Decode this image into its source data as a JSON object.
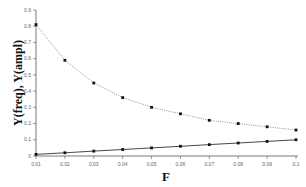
{
  "chart_data": {
    "type": "line",
    "title": "",
    "xlabel": "F",
    "ylabel": "Y(freq), Y(ampl)",
    "x": [
      0.01,
      0.02,
      0.03,
      0.04,
      0.05,
      0.06,
      0.07,
      0.08,
      0.09,
      0.1
    ],
    "x_tick_labels": [
      "0.01",
      "0.02",
      "0.03",
      "0.04",
      "0.05",
      "0.06",
      "0.07",
      "0.08",
      "0.09",
      "0.1"
    ],
    "y_tick_labels": [
      "0",
      "0.1",
      "0.2",
      "0.3",
      "0.4",
      "0.5",
      "0.6",
      "0.7",
      "0.8",
      "0.9"
    ],
    "xlim": [
      0.01,
      0.1
    ],
    "ylim": [
      0,
      0.9
    ],
    "grid": false,
    "legend": null,
    "series": [
      {
        "name": "Y(ampl)",
        "style": "dotted",
        "values": [
          0.81,
          0.59,
          0.45,
          0.36,
          0.3,
          0.26,
          0.22,
          0.2,
          0.18,
          0.16
        ]
      },
      {
        "name": "Y(freq)",
        "style": "solid",
        "values": [
          0.01,
          0.02,
          0.03,
          0.04,
          0.05,
          0.06,
          0.07,
          0.08,
          0.09,
          0.1
        ]
      }
    ]
  }
}
